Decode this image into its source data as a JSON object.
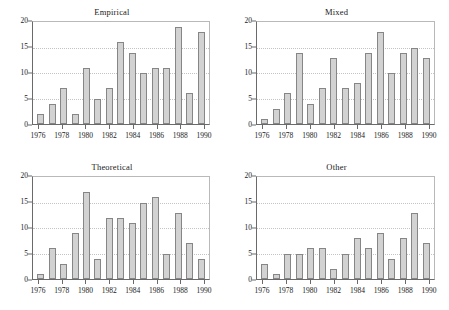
{
  "figure": {
    "panels": [
      "Empirical",
      "Mixed",
      "Theoretical",
      "Other"
    ]
  },
  "chart_data": [
    {
      "type": "bar",
      "title": "Empirical",
      "xlabel": "",
      "ylabel": "",
      "categories": [
        "1976",
        "1977",
        "1978",
        "1979",
        "1980",
        "1981",
        "1982",
        "1983",
        "1984",
        "1985",
        "1986",
        "1987",
        "1988",
        "1989",
        "1990"
      ],
      "values": [
        2,
        4,
        7,
        2,
        11,
        5,
        7,
        16,
        14,
        10,
        11,
        11,
        19,
        6,
        18
      ],
      "ylim": [
        0,
        20
      ],
      "yticks": [
        0,
        5,
        10,
        15,
        20
      ],
      "xticks": [
        "1976",
        "1978",
        "1980",
        "1982",
        "1984",
        "1986",
        "1988",
        "1990"
      ],
      "grid": true,
      "legend": "none",
      "bar_fill": "#d2d2d2",
      "bar_edge": "#868686"
    },
    {
      "type": "bar",
      "title": "Mixed",
      "xlabel": "",
      "ylabel": "",
      "categories": [
        "1976",
        "1977",
        "1978",
        "1979",
        "1980",
        "1981",
        "1982",
        "1983",
        "1984",
        "1985",
        "1986",
        "1987",
        "1988",
        "1989",
        "1990"
      ],
      "values": [
        1,
        3,
        6,
        14,
        4,
        7,
        13,
        7,
        8,
        14,
        18,
        10,
        14,
        15,
        13
      ],
      "ylim": [
        0,
        20
      ],
      "yticks": [
        0,
        5,
        10,
        15,
        20
      ],
      "xticks": [
        "1976",
        "1978",
        "1980",
        "1982",
        "1984",
        "1986",
        "1988",
        "1990"
      ],
      "grid": true,
      "legend": "none",
      "bar_fill": "#d2d2d2",
      "bar_edge": "#868686"
    },
    {
      "type": "bar",
      "title": "Theoretical",
      "xlabel": "",
      "ylabel": "",
      "categories": [
        "1976",
        "1977",
        "1978",
        "1979",
        "1980",
        "1981",
        "1982",
        "1983",
        "1984",
        "1985",
        "1986",
        "1987",
        "1988",
        "1989",
        "1990"
      ],
      "values": [
        1,
        6,
        3,
        9,
        17,
        4,
        12,
        12,
        11,
        15,
        16,
        5,
        13,
        7,
        4
      ],
      "ylim": [
        0,
        20
      ],
      "yticks": [
        0,
        5,
        10,
        15,
        20
      ],
      "xticks": [
        "1976",
        "1978",
        "1980",
        "1982",
        "1984",
        "1986",
        "1988",
        "1990"
      ],
      "grid": true,
      "legend": "none",
      "bar_fill": "#d2d2d2",
      "bar_edge": "#868686"
    },
    {
      "type": "bar",
      "title": "Other",
      "xlabel": "",
      "ylabel": "",
      "categories": [
        "1976",
        "1977",
        "1978",
        "1979",
        "1980",
        "1981",
        "1982",
        "1983",
        "1984",
        "1985",
        "1986",
        "1987",
        "1988",
        "1989",
        "1990"
      ],
      "values": [
        3,
        1,
        5,
        5,
        6,
        6,
        2,
        5,
        8,
        6,
        9,
        4,
        8,
        13,
        7
      ],
      "ylim": [
        0,
        20
      ],
      "yticks": [
        0,
        5,
        10,
        15,
        20
      ],
      "xticks": [
        "1976",
        "1978",
        "1980",
        "1982",
        "1984",
        "1986",
        "1988",
        "1990"
      ],
      "grid": true,
      "legend": "none",
      "bar_fill": "#d2d2d2",
      "bar_edge": "#868686"
    }
  ]
}
